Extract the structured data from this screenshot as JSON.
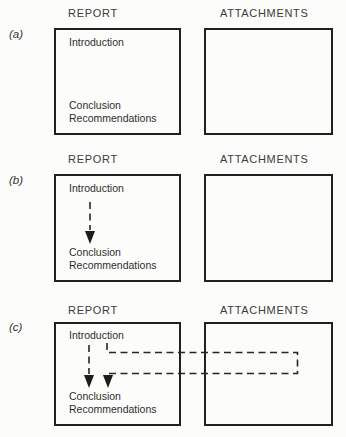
{
  "figure": {
    "sections": [
      {
        "label": "(a)",
        "report_header": "REPORT",
        "attachments_header": "ATTACHMENTS",
        "report": {
          "intro": "Introduction",
          "conclusion": "Conclusion",
          "recommendations": "Recommendations"
        }
      },
      {
        "label": "(b)",
        "report_header": "REPORT",
        "attachments_header": "ATTACHMENTS",
        "report": {
          "intro": "Introduction",
          "conclusion": "Conclusion",
          "recommendations": "Recommendations"
        }
      },
      {
        "label": "(c)",
        "report_header": "REPORT",
        "attachments_header": "ATTACHMENTS",
        "report": {
          "intro": "Introduction",
          "conclusion": "Conclusion",
          "recommendations": "Recommendations"
        }
      }
    ],
    "arrows": [
      {
        "id": "b-intro-to-conclusion",
        "style": "dashed",
        "meaning": "flow from Introduction to Conclusion inside report"
      },
      {
        "id": "c-intro-to-conclusion",
        "style": "dashed",
        "meaning": "flow from Introduction to Conclusion inside report"
      },
      {
        "id": "c-intro-via-attachments-to-conclusion",
        "style": "dashed",
        "meaning": "flow from Introduction out through Attachments and back to Conclusion"
      }
    ],
    "colors": {
      "background": "#fcfcfa",
      "line": "#212121",
      "text": "#2e2e2e"
    }
  }
}
